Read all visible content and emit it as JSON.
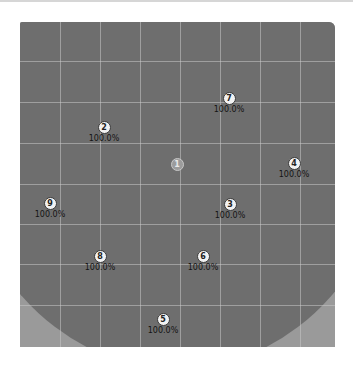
{
  "view": {
    "background_color": "#ffffff",
    "field_color": "#9a9a9a",
    "fov_color": "#6e6e6e",
    "grid_color": "#c8c8c8"
  },
  "grid": {
    "vertical_x": [
      40,
      80,
      120,
      160,
      200,
      240,
      280
    ],
    "horizontal_y": [
      39,
      80,
      121,
      162,
      202,
      242,
      283
    ]
  },
  "markers": [
    {
      "id": "1",
      "label": "",
      "x": 177,
      "y": 158,
      "center": true
    },
    {
      "id": "2",
      "label": "100.0%",
      "x": 104,
      "y": 121
    },
    {
      "id": "3",
      "label": "100.0%",
      "x": 230,
      "y": 198
    },
    {
      "id": "4",
      "label": "100.0%",
      "x": 294,
      "y": 157
    },
    {
      "id": "5",
      "label": "100.0%",
      "x": 163,
      "y": 313
    },
    {
      "id": "6",
      "label": "100.0%",
      "x": 203,
      "y": 250
    },
    {
      "id": "7",
      "label": "100.0%",
      "x": 229,
      "y": 92
    },
    {
      "id": "8",
      "label": "100.0%",
      "x": 100,
      "y": 250
    },
    {
      "id": "9",
      "label": "100.0%",
      "x": 50,
      "y": 197
    }
  ]
}
